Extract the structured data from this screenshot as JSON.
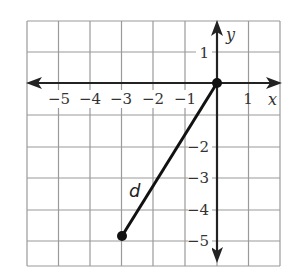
{
  "diagram": {
    "type": "coordinate-grid",
    "x_axis": {
      "label": "x",
      "ticks": [
        "−5",
        "−4",
        "−3",
        "−2",
        "−1",
        "1"
      ],
      "range": [
        -6,
        2
      ]
    },
    "y_axis": {
      "label": "y",
      "ticks": [
        "1",
        "−2",
        "−3",
        "−4",
        "−5"
      ],
      "range": [
        -6,
        2
      ]
    },
    "segment": {
      "label": "d",
      "start": [
        -3,
        -5
      ],
      "end": [
        0,
        0
      ]
    },
    "colors": {
      "grid": "#999999",
      "axis": "#222222",
      "segment": "#111111"
    }
  }
}
